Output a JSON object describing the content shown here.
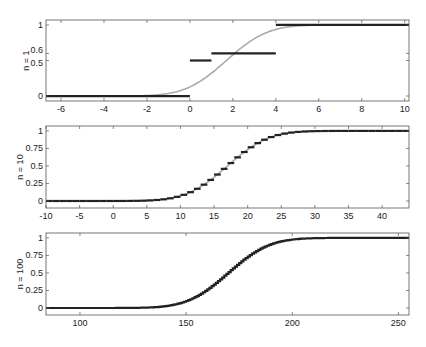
{
  "chart_data": [
    {
      "type": "line",
      "panel": 1,
      "ylabel": "n = 1",
      "xlim": [
        -6.7,
        10.2
      ],
      "ylim": [
        -0.07,
        1.07
      ],
      "xticks": [
        -6,
        -4,
        -2,
        0,
        2,
        4,
        6,
        8,
        10
      ],
      "yticks": [
        0,
        0.5,
        0.6,
        1
      ],
      "ytick_labels": [
        "0",
        "0.5",
        "0.6",
        "1"
      ],
      "series": [
        {
          "name": "empirical CDF (steps)",
          "style": "step",
          "color": "#222222",
          "segments": [
            {
              "x0": -6.7,
              "x1": 0,
              "y": 0
            },
            {
              "x0": 0,
              "x1": 1,
              "y": 0.5
            },
            {
              "x0": 1,
              "x1": 4,
              "y": 0.6
            },
            {
              "x0": 4,
              "x1": 10.2,
              "y": 1
            }
          ]
        },
        {
          "name": "normal approximation",
          "style": "smooth",
          "color": "#aaaaaa",
          "mean": 1.7,
          "sd": 1.5
        }
      ]
    },
    {
      "type": "line",
      "panel": 2,
      "ylabel": "n = 10",
      "xlim": [
        -10,
        44
      ],
      "ylim": [
        -0.1,
        1.07
      ],
      "xticks": [
        -10,
        -5,
        0,
        5,
        10,
        15,
        20,
        25,
        30,
        35,
        40
      ],
      "yticks": [
        0,
        0.25,
        0.5,
        0.75,
        1
      ],
      "ytick_labels": [
        "0",
        "0.25",
        "0.5",
        "0.75",
        "1"
      ],
      "series": [
        {
          "name": "empirical CDF (steps)",
          "style": "step",
          "color": "#222222",
          "step_width": 1,
          "mean": 17,
          "sd": 4.8
        },
        {
          "name": "normal approximation",
          "style": "smooth",
          "color": "#aaaaaa",
          "mean": 17,
          "sd": 4.8
        }
      ]
    },
    {
      "type": "line",
      "panel": 3,
      "ylabel": "n = 100",
      "xlim": [
        84,
        255
      ],
      "ylim": [
        -0.1,
        1.07
      ],
      "xticks": [
        100,
        150,
        200,
        250
      ],
      "yticks": [
        0,
        0.25,
        0.5,
        0.75,
        1
      ],
      "ytick_labels": [
        "0",
        "0.25",
        "0.5",
        "0.75",
        "1"
      ],
      "series": [
        {
          "name": "empirical CDF (steps)",
          "style": "step",
          "color": "#222222",
          "step_width": 1,
          "mean": 170,
          "sd": 15.2
        }
      ]
    }
  ]
}
